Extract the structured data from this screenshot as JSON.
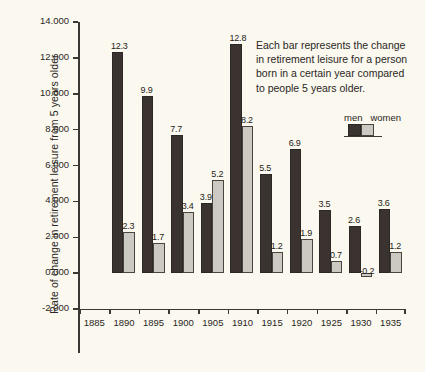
{
  "chart_data": {
    "type": "bar",
    "title": "",
    "xlabel": "",
    "ylabel": "Rate of change in retirement leisure from 5 years older",
    "categories": [
      "1885",
      "1890",
      "1895",
      "1900",
      "1905",
      "1910",
      "1915",
      "1920",
      "1925",
      "1930",
      "1935"
    ],
    "series": [
      {
        "name": "men",
        "color": "#3a3330",
        "values": [
          null,
          12.3,
          9.9,
          7.7,
          3.9,
          12.8,
          5.5,
          6.9,
          3.5,
          2.6,
          3.6
        ]
      },
      {
        "name": "women",
        "color": "#ccc9c2",
        "values": [
          null,
          2.3,
          1.7,
          3.4,
          5.2,
          8.2,
          1.2,
          1.9,
          0.7,
          -0.2,
          1.2
        ]
      }
    ],
    "ylim": [
      -2.0,
      14.0
    ],
    "ytick_labels": [
      "14.000",
      "12.000",
      "10.000",
      "8.000",
      "6.000",
      "4.000",
      "2.000",
      "0.000",
      "-2.000"
    ],
    "ytick_values": [
      14,
      12,
      10,
      8,
      6,
      4,
      2,
      0,
      -2
    ],
    "grid": false,
    "legend_position": "upper-right-inside",
    "annotation": [
      "Each bar represents the change",
      "in retirement leisure for a person",
      "born in a certain year compared",
      "to people 5 years older."
    ],
    "bar_labels": {
      "men": [
        "",
        "12.3",
        "9.9",
        "7.7",
        "3.9",
        "12.8",
        "5.5",
        "6.9",
        "3.5",
        "2.6",
        "3.6"
      ],
      "women": [
        "",
        "2.3",
        "1.7",
        "3.4",
        "5.2",
        "8.2",
        "1.2",
        "1.9",
        "0.7",
        "-0.2",
        "1.2"
      ]
    }
  },
  "legend": {
    "men_label": "men",
    "women_label": "women"
  },
  "colors": {
    "background": "#faf8ef",
    "axis": "#3c3733",
    "men_bar": "#3a3330",
    "women_bar": "#ccc9c2",
    "text": "#2b2724"
  }
}
